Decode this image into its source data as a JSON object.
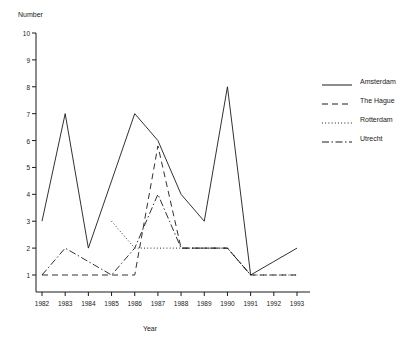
{
  "chart_data": {
    "type": "line",
    "title": "",
    "xlabel": "Year",
    "ylabel": "Number",
    "x": [
      1982,
      1983,
      1984,
      1985,
      1986,
      1987,
      1988,
      1989,
      1990,
      1991,
      1992,
      1993
    ],
    "categories": [
      "1982",
      "1983",
      "1984",
      "1985",
      "1986",
      "1987",
      "1988",
      "1989",
      "1990",
      "1991",
      "1992",
      "1993"
    ],
    "xlim": [
      1982,
      1993
    ],
    "ylim": [
      1,
      10
    ],
    "yticks": [
      1,
      2,
      3,
      4,
      5,
      6,
      7,
      8,
      9,
      10
    ],
    "ytick_labels": [
      "1",
      "2",
      "3",
      "4",
      "5",
      "6",
      "7",
      "8",
      "9",
      "10"
    ],
    "grid": false,
    "legend_position": "right",
    "series": [
      {
        "name": "Amsterdam",
        "style": "solid",
        "color": "#1a1a1a",
        "x": [
          1982,
          1983,
          1984,
          1985,
          1986,
          1987,
          1988,
          1989,
          1990,
          1991,
          1992,
          1993
        ],
        "values": [
          3,
          7,
          2,
          4.5,
          7,
          6,
          4,
          3,
          8,
          1,
          1.5,
          2
        ]
      },
      {
        "name": "The Hague",
        "style": "dashed",
        "color": "#1a1a1a",
        "x": [
          1982,
          1983,
          1984,
          1985,
          1986,
          1987,
          1988,
          1989,
          1990,
          1991,
          1992,
          1993
        ],
        "values": [
          1,
          1,
          1,
          1,
          1,
          5.8,
          2,
          2,
          2,
          1,
          1,
          1
        ]
      },
      {
        "name": "Rotterdam",
        "style": "dotted",
        "color": "#1a1a1a",
        "x": [
          1985,
          1986,
          1987,
          1988,
          1989,
          1990,
          1991,
          1992,
          1993
        ],
        "values": [
          3,
          2,
          2,
          2,
          2,
          2,
          1,
          1,
          1
        ]
      },
      {
        "name": "Utrecht",
        "style": "dashdot",
        "color": "#1a1a1a",
        "x": [
          1982,
          1983,
          1984,
          1985,
          1986,
          1987,
          1988,
          1989,
          1990,
          1991
        ],
        "values": [
          1,
          2,
          1.5,
          1,
          2,
          4,
          2,
          2,
          2,
          1
        ]
      }
    ]
  },
  "legend": {
    "items": [
      {
        "label": "Amsterdam"
      },
      {
        "label": "The Hague"
      },
      {
        "label": "Rotterdam"
      },
      {
        "label": "Utrecht"
      }
    ]
  }
}
